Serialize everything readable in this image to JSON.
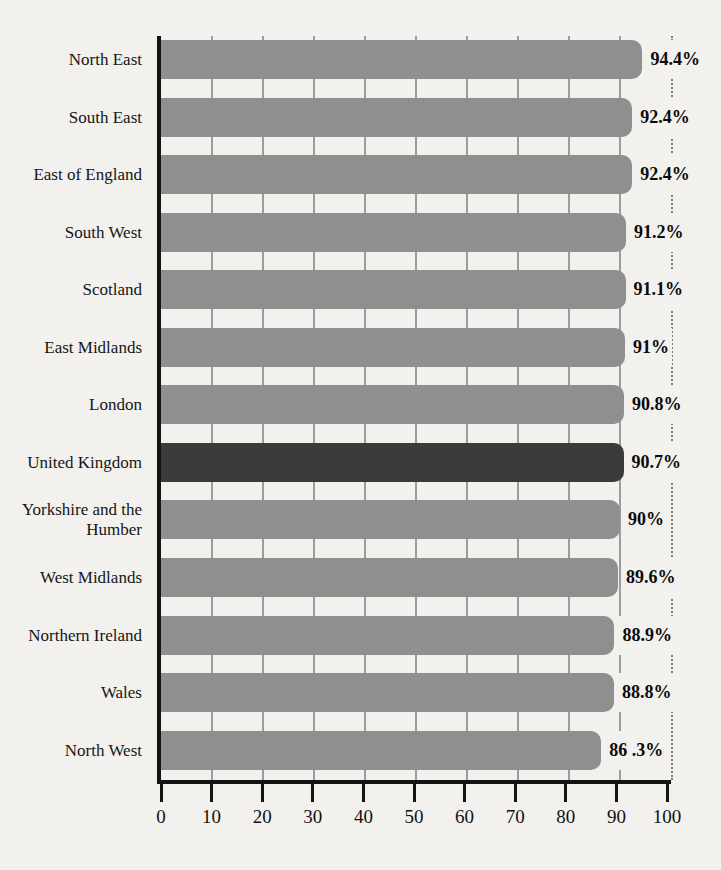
{
  "chart_data": {
    "type": "bar",
    "orientation": "horizontal",
    "title": "",
    "categories": [
      "North East",
      "South East",
      "East of England",
      "South West",
      "Scotland",
      "East Midlands",
      "London",
      "United Kingdom",
      "Yorkshire and the Humber",
      "West Midlands",
      "Northern Ireland",
      "Wales",
      "North West"
    ],
    "values": [
      94.4,
      92.4,
      92.4,
      91.2,
      91.1,
      91,
      90.8,
      90.7,
      90,
      89.6,
      88.9,
      88.8,
      86.3
    ],
    "value_labels": [
      "94.4%",
      "92.4%",
      "92.4%",
      "91.2%",
      "91.1%",
      "91%",
      "90.8%",
      "90.7%",
      "90%",
      "89.6%",
      "88.9%",
      "88.8%",
      "86 .3%"
    ],
    "highlight_index": 7,
    "highlight_category": "United Kingdom",
    "xlim": [
      0,
      100
    ],
    "x_ticks": [
      "0",
      "10",
      "20",
      "30",
      "40",
      "50",
      "60",
      "70",
      "80",
      "90",
      "100"
    ],
    "gridlines_at": [
      10,
      20,
      30,
      40,
      50,
      60,
      70,
      80,
      90
    ],
    "reference_line_at": 100,
    "legend": "none",
    "colors": {
      "bar": "#8f8f8f",
      "bar_highlight": "#3b3b3b",
      "background": "#f2f1ee",
      "gridline": "#9c9c9c",
      "reference_line": "#7e7e7e",
      "axis": "#141414",
      "text": "#161616"
    }
  }
}
